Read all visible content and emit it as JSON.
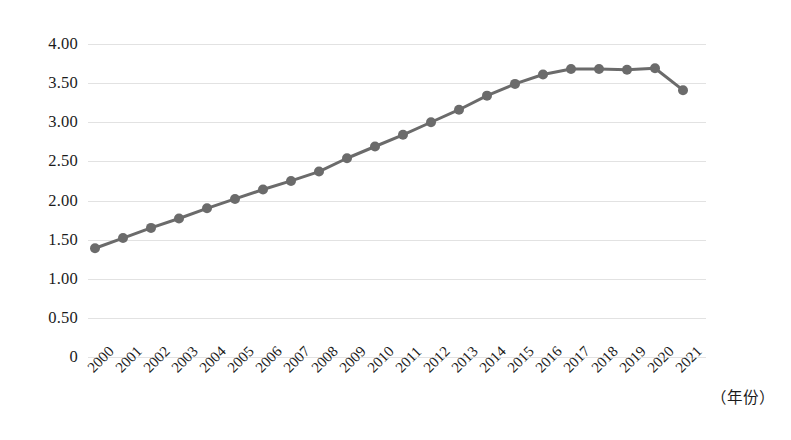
{
  "chart_data": {
    "type": "line",
    "title": "",
    "subtitle": "",
    "xlabel": "（年份）",
    "ylabel": "",
    "categories": [
      "2000",
      "2001",
      "2002",
      "2003",
      "2004",
      "2005",
      "2006",
      "2007",
      "2008",
      "2009",
      "2010",
      "2011",
      "2012",
      "2013",
      "2014",
      "2015",
      "2016",
      "2017",
      "2018",
      "2019",
      "2020",
      "2021"
    ],
    "values": [
      1.39,
      1.52,
      1.65,
      1.77,
      1.9,
      2.02,
      2.14,
      2.25,
      2.37,
      2.54,
      2.69,
      2.84,
      3.0,
      3.16,
      3.34,
      3.49,
      3.61,
      3.68,
      3.68,
      3.67,
      3.69,
      3.41
    ],
    "series": [
      {
        "name": "",
        "values": [
          1.39,
          1.52,
          1.65,
          1.77,
          1.9,
          2.02,
          2.14,
          2.25,
          2.37,
          2.54,
          2.69,
          2.84,
          3.0,
          3.16,
          3.34,
          3.49,
          3.61,
          3.68,
          3.68,
          3.67,
          3.69,
          3.41
        ]
      }
    ],
    "ytick_labels": [
      "4.00",
      "3.50",
      "3.00",
      "2.50",
      "2.00",
      "1.50",
      "1.00",
      "0.50",
      "0"
    ],
    "ytick_values": [
      4.0,
      3.5,
      3.0,
      2.5,
      2.0,
      1.5,
      1.0,
      0.5,
      0
    ],
    "ylim": [
      0,
      4.0
    ],
    "xlim_labels": [
      "2000",
      "2021"
    ],
    "grid": "horizontal",
    "legend": "none",
    "annotations": [],
    "colors": {
      "line": "#6b6b6b",
      "marker": "#6b6b6b",
      "gridline": "#e2e2e2",
      "text": "#1b1b1b",
      "background": "#ffffff"
    },
    "style": {
      "line_width_px": 3,
      "marker_radius_px": 5,
      "marker_shape": "circle"
    }
  }
}
